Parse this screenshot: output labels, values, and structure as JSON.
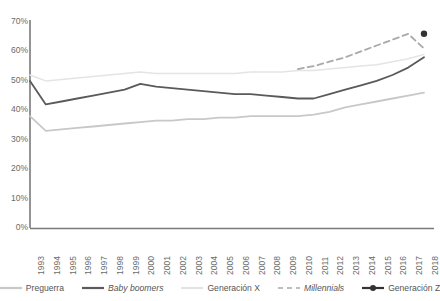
{
  "chart_data": {
    "type": "line",
    "title": "",
    "xlabel": "",
    "ylabel": "",
    "grid": false,
    "legend_position": "bottom",
    "ylim": [
      0,
      70
    ],
    "ytick_labels": [
      "70%",
      "60%",
      "50%",
      "40%",
      "30%",
      "20%",
      "10%",
      "0%"
    ],
    "ytick_values": [
      70,
      60,
      50,
      40,
      30,
      20,
      10,
      0
    ],
    "categories": [
      "1993",
      "1994",
      "1995",
      "1996",
      "1997",
      "1998",
      "1999",
      "2000",
      "2001",
      "2002",
      "2003",
      "2004",
      "2005",
      "2006",
      "2007",
      "2008",
      "2009",
      "2010",
      "2011",
      "2012",
      "2013",
      "2014",
      "2015",
      "2016",
      "2017",
      "2018"
    ],
    "series": [
      {
        "name": "Preguerra",
        "color": "#c8c8c8",
        "style": "solid",
        "marker": "none",
        "values": [
          38,
          33,
          33.5,
          34,
          34.5,
          35,
          35.5,
          36,
          36.5,
          36.5,
          37,
          37,
          37.5,
          37.5,
          38,
          38,
          38,
          38,
          38.5,
          39.5,
          41,
          42,
          43,
          44,
          45,
          46
        ]
      },
      {
        "name": "Baby boomers",
        "color": "#5a5a5a",
        "style": "solid",
        "marker": "none",
        "values": [
          50,
          42,
          43,
          44,
          45,
          46,
          47,
          49,
          48,
          47.5,
          47,
          46.5,
          46,
          45.5,
          45.5,
          45,
          44.5,
          44,
          44,
          45.5,
          47,
          48.5,
          50,
          52,
          54.5,
          58
        ]
      },
      {
        "name": "Generación X",
        "color": "#e4e4e4",
        "style": "solid",
        "marker": "none",
        "values": [
          52,
          50,
          50.5,
          51,
          51.5,
          52,
          52.5,
          53,
          52.5,
          52.5,
          52.5,
          52.5,
          52.5,
          52.5,
          53,
          53,
          53,
          53.5,
          53.5,
          54,
          54.5,
          55,
          55.5,
          56.5,
          57.5,
          59
        ]
      },
      {
        "name": "Millennials",
        "color": "#a9a9a9",
        "style": "dashed",
        "marker": "none",
        "start_index": 17,
        "values": [
          null,
          null,
          null,
          null,
          null,
          null,
          null,
          null,
          null,
          null,
          null,
          null,
          null,
          null,
          null,
          null,
          null,
          54,
          55,
          56.5,
          58,
          60,
          62,
          64,
          66,
          61
        ]
      },
      {
        "name": "Generación Z",
        "color": "#333333",
        "style": "solid",
        "marker": "dot",
        "values": [
          null,
          null,
          null,
          null,
          null,
          null,
          null,
          null,
          null,
          null,
          null,
          null,
          null,
          null,
          null,
          null,
          null,
          null,
          null,
          null,
          null,
          null,
          null,
          null,
          null,
          66
        ]
      }
    ]
  },
  "legend": {
    "items": [
      {
        "label": "Preguerra",
        "color": "#c8c8c8",
        "style": "solid",
        "italic": false,
        "marker": "none"
      },
      {
        "label": "Baby boomers",
        "color": "#5a5a5a",
        "style": "solid",
        "italic": true,
        "marker": "none"
      },
      {
        "label": "Generación X",
        "color": "#e4e4e4",
        "style": "solid",
        "italic": false,
        "marker": "none"
      },
      {
        "label": "Millennials",
        "color": "#a9a9a9",
        "style": "dashed",
        "italic": true,
        "marker": "none"
      },
      {
        "label": "Generación Z",
        "color": "#333333",
        "style": "solid",
        "italic": false,
        "marker": "dot"
      }
    ]
  },
  "axes": {
    "axis_color": "#7a7a7a",
    "tick_text_color": "#6b6b6b"
  }
}
